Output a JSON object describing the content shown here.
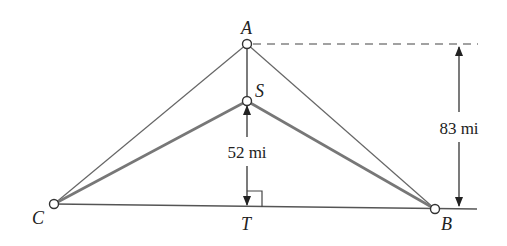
{
  "diagram": {
    "points": {
      "A": {
        "label": "A",
        "x": 247,
        "y": 44
      },
      "S": {
        "label": "S",
        "x": 247,
        "y": 101
      },
      "C": {
        "label": "C",
        "x": 54,
        "y": 204
      },
      "B": {
        "label": "B",
        "x": 435,
        "y": 209
      },
      "T": {
        "label": "T",
        "x": 247,
        "y": 207
      }
    },
    "dimensions": {
      "ST": "52 mi",
      "A_to_CB": "83 mi"
    },
    "colors": {
      "line": "#555555",
      "thick_line": "#666666",
      "text": "#222222"
    }
  }
}
